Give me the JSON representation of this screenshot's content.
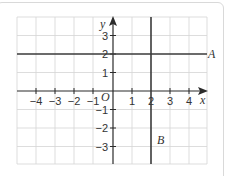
{
  "diagram": {
    "type": "coordinate-grid",
    "x_axis_label": "x",
    "y_axis_label": "y",
    "origin_label": "O",
    "x_ticks": [
      {
        "value": -4,
        "label": "−4"
      },
      {
        "value": -3,
        "label": "−3"
      },
      {
        "value": -2,
        "label": "−2"
      },
      {
        "value": -1,
        "label": "−1"
      },
      {
        "value": 1,
        "label": "1"
      },
      {
        "value": 2,
        "label": "2"
      },
      {
        "value": 3,
        "label": "3"
      },
      {
        "value": 4,
        "label": "4"
      }
    ],
    "y_ticks": [
      {
        "value": 3,
        "label": "3"
      },
      {
        "value": 2,
        "label": "2"
      },
      {
        "value": 1,
        "label": "1"
      },
      {
        "value": -1,
        "label": "−1"
      },
      {
        "value": -2,
        "label": "−2"
      },
      {
        "value": -3,
        "label": "−3"
      }
    ],
    "x_range": [
      -5,
      5
    ],
    "y_range": [
      -4,
      4
    ],
    "lines": [
      {
        "name": "A",
        "equation": "y = 2",
        "orientation": "horizontal",
        "value": 2,
        "label": "A"
      },
      {
        "name": "B",
        "equation": "x = 2",
        "orientation": "vertical",
        "value": 2,
        "label": "B"
      }
    ]
  }
}
